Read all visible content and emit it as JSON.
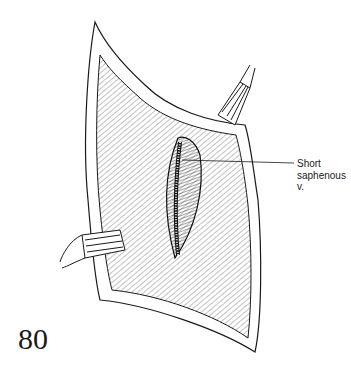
{
  "figure": {
    "number": "80",
    "labels": [
      {
        "id": "short-saphenous-vein",
        "lines": [
          "Short",
          "saphenous",
          "v."
        ]
      }
    ],
    "colors": {
      "ink": "#1a1a1a",
      "background": "#ffffff"
    }
  }
}
